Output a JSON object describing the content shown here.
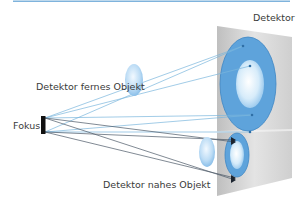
{
  "diagram": {
    "labels": {
      "detector": "Detektor",
      "far_object_detector": "Detektor fernes Objekt",
      "focus": "Fokus",
      "near_object_detector": "Detektor nahes Objekt"
    },
    "colors": {
      "accent_line": "#7fb3dc",
      "ray_light": "#7ab6dd",
      "ray_dark": "#4a5866",
      "image_blue": "#5ea3db",
      "image_blue_edge": "#3f86c4",
      "object_blue": "#a9d3f2",
      "detector_panel": "#d9d9d9",
      "focus_bar": "#111111"
    }
  }
}
